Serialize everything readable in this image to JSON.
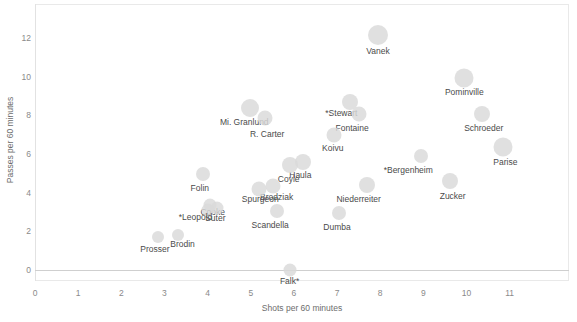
{
  "chart_data": {
    "type": "scatter",
    "title": "",
    "xlabel": "Shots per 60 minutes",
    "ylabel": "Passes per 60 minutes",
    "xlim": [
      0,
      11.6
    ],
    "ylim": [
      -0.45,
      12.9
    ],
    "xticks": [
      0,
      1,
      2,
      3,
      4,
      5,
      6,
      7,
      8,
      9,
      10,
      11
    ],
    "yticks": [
      0,
      2,
      4,
      6,
      8,
      10,
      12
    ],
    "grid": false,
    "legend": null,
    "marker": "bubble",
    "marker_color": "#d9d9d9",
    "points": [
      {
        "label": "Vanek",
        "x": 7.95,
        "y": 12.15,
        "size": 20,
        "lx": 7.95,
        "ly": 11.3
      },
      {
        "label": "Pominville",
        "x": 9.95,
        "y": 9.95,
        "size": 19,
        "lx": 9.95,
        "ly": 9.15
      },
      {
        "label": "*Stewart",
        "x": 7.3,
        "y": 8.7,
        "size": 16,
        "lx": 7.1,
        "ly": 8.05
      },
      {
        "label": "Mi. Granlund",
        "x": 4.98,
        "y": 8.4,
        "size": 18,
        "lx": 4.85,
        "ly": 7.62
      },
      {
        "label": "Fontaine",
        "x": 7.5,
        "y": 8.05,
        "size": 15,
        "lx": 7.35,
        "ly": 7.32
      },
      {
        "label": "Schroeder",
        "x": 10.35,
        "y": 8.05,
        "size": 16,
        "lx": 10.4,
        "ly": 7.3
      },
      {
        "label": "R. Carter",
        "x": 5.32,
        "y": 7.85,
        "size": 15,
        "lx": 5.38,
        "ly": 7.0
      },
      {
        "label": "Koivu",
        "x": 6.93,
        "y": 7.0,
        "size": 15,
        "lx": 6.9,
        "ly": 6.25
      },
      {
        "label": "Parise",
        "x": 10.85,
        "y": 6.35,
        "size": 19,
        "lx": 10.9,
        "ly": 5.55
      },
      {
        "label": "*Bergenheim",
        "x": 8.95,
        "y": 5.9,
        "size": 14,
        "lx": 8.65,
        "ly": 5.12
      },
      {
        "label": "Haula",
        "x": 6.22,
        "y": 5.6,
        "size": 16,
        "lx": 6.15,
        "ly": 4.85
      },
      {
        "label": "Coyle",
        "x": 5.9,
        "y": 5.45,
        "size": 16,
        "lx": 5.88,
        "ly": 4.68
      },
      {
        "label": "Folin",
        "x": 3.9,
        "y": 4.95,
        "size": 14,
        "lx": 3.82,
        "ly": 4.18
      },
      {
        "label": "Zucker",
        "x": 9.62,
        "y": 4.58,
        "size": 16,
        "lx": 9.68,
        "ly": 3.78
      },
      {
        "label": "Niederreiter",
        "x": 7.7,
        "y": 4.4,
        "size": 16,
        "lx": 7.5,
        "ly": 3.62
      },
      {
        "label": "Brodziak",
        "x": 5.52,
        "y": 4.35,
        "size": 15,
        "lx": 5.6,
        "ly": 3.72
      },
      {
        "label": "Spurgeon",
        "x": 5.18,
        "y": 4.2,
        "size": 15,
        "lx": 5.22,
        "ly": 3.6
      },
      {
        "label": "Cooke",
        "x": 4.05,
        "y": 3.38,
        "size": 13,
        "lx": 4.12,
        "ly": 2.95
      },
      {
        "label": "Suter",
        "x": 4.22,
        "y": 3.22,
        "size": 13,
        "lx": 4.18,
        "ly": 2.62
      },
      {
        "label": "*Leopold",
        "x": 4.02,
        "y": 3.1,
        "size": 13,
        "lx": 3.72,
        "ly": 2.68
      },
      {
        "label": "Scandella",
        "x": 5.6,
        "y": 3.05,
        "size": 14,
        "lx": 5.45,
        "ly": 2.28
      },
      {
        "label": "Dumba",
        "x": 7.05,
        "y": 2.95,
        "size": 14,
        "lx": 7.0,
        "ly": 2.18
      },
      {
        "label": "Brodin",
        "x": 3.32,
        "y": 1.8,
        "size": 12,
        "lx": 3.42,
        "ly": 1.28
      },
      {
        "label": "Prosser",
        "x": 2.85,
        "y": 1.7,
        "size": 12,
        "lx": 2.78,
        "ly": 1.02
      },
      {
        "label": "Falk*",
        "x": 5.9,
        "y": 0.02,
        "size": 13,
        "lx": 5.9,
        "ly": -0.62
      }
    ]
  },
  "axes": {
    "x_title": "Shots per 60 minutes",
    "y_title": "Passes per 60 minutes",
    "x_tick_labels": [
      "0",
      "1",
      "2",
      "3",
      "4",
      "5",
      "6",
      "7",
      "8",
      "9",
      "10",
      "11"
    ],
    "y_tick_labels": [
      "0",
      "2",
      "4",
      "6",
      "8",
      "10",
      "12"
    ]
  },
  "colors": {
    "bubble": "#d9d9d9",
    "tick_text": "#8a8a8a",
    "label_text": "#4a4a4a",
    "axis_title": "#6d6d6d",
    "frame": "#e9e9e9",
    "zero_line": "#cfcfcf",
    "background": "#ffffff"
  }
}
